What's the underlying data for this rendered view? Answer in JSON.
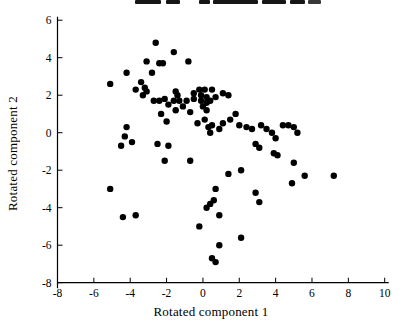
{
  "chart_data": {
    "type": "scatter",
    "title": "",
    "xlabel": "Rotated component 1",
    "ylabel": "Rotated component 2",
    "xlim": [
      -8,
      10
    ],
    "ylim": [
      -8,
      6
    ],
    "x_ticks": [
      -8,
      -6,
      -4,
      -2,
      0,
      2,
      4,
      6,
      8,
      10
    ],
    "y_ticks": [
      -8,
      -6,
      -4,
      -2,
      0,
      2,
      4,
      6
    ],
    "grid": false,
    "legend": false,
    "marker": "filled-circle",
    "marker_color": "#000000",
    "axis_color": "#000000",
    "background_color": "#ffffff",
    "points": [
      [
        -2.6,
        4.8
      ],
      [
        -1.6,
        4.3
      ],
      [
        -0.8,
        3.8
      ],
      [
        -3.1,
        3.8
      ],
      [
        -2.4,
        3.7
      ],
      [
        -2.2,
        3.7
      ],
      [
        -2.8,
        3.2
      ],
      [
        -4.2,
        3.2
      ],
      [
        -5.1,
        2.6
      ],
      [
        -3.7,
        2.3
      ],
      [
        -3.4,
        2.7
      ],
      [
        -3.2,
        2.4
      ],
      [
        -3.3,
        2.0
      ],
      [
        -3.1,
        2.2
      ],
      [
        -2.7,
        1.7
      ],
      [
        -2.4,
        1.7
      ],
      [
        -2.1,
        1.8
      ],
      [
        -1.9,
        1.5
      ],
      [
        -1.6,
        1.7
      ],
      [
        -1.5,
        2.2
      ],
      [
        -1.4,
        2.0
      ],
      [
        -1.3,
        1.7
      ],
      [
        -1.5,
        1.2
      ],
      [
        -1.1,
        1.4
      ],
      [
        -0.9,
        1.7
      ],
      [
        -0.7,
        1.1
      ],
      [
        -0.5,
        1.8
      ],
      [
        -0.5,
        2.1
      ],
      [
        -0.2,
        2.3
      ],
      [
        -0.1,
        2.0
      ],
      [
        0.1,
        2.3
      ],
      [
        -0.1,
        1.7
      ],
      [
        0.2,
        1.9
      ],
      [
        0.2,
        1.6
      ],
      [
        0.0,
        1.4
      ],
      [
        0.2,
        1.2
      ],
      [
        0.4,
        1.7
      ],
      [
        0.5,
        2.3
      ],
      [
        0.7,
        1.9
      ],
      [
        1.1,
        2.1
      ],
      [
        1.4,
        2.0
      ],
      [
        1.8,
        1.0
      ],
      [
        1.5,
        0.7
      ],
      [
        -2.3,
        1.0
      ],
      [
        -2.0,
        0.6
      ],
      [
        0.1,
        0.7
      ],
      [
        0.5,
        0.4
      ],
      [
        0.9,
        0.2
      ],
      [
        1.1,
        0.5
      ],
      [
        0.3,
        0.3
      ],
      [
        0.4,
        0.0
      ],
      [
        -0.3,
        0.5
      ],
      [
        2.0,
        0.4
      ],
      [
        2.4,
        0.3
      ],
      [
        2.7,
        0.2
      ],
      [
        3.2,
        0.4
      ],
      [
        3.5,
        0.2
      ],
      [
        3.8,
        0.0
      ],
      [
        4.0,
        -0.3
      ],
      [
        4.4,
        0.4
      ],
      [
        4.7,
        0.4
      ],
      [
        5.0,
        0.3
      ],
      [
        5.2,
        0.0
      ],
      [
        2.9,
        -0.6
      ],
      [
        3.1,
        -0.8
      ],
      [
        3.9,
        -1.1
      ],
      [
        4.1,
        -1.2
      ],
      [
        5.0,
        -1.6
      ],
      [
        5.6,
        -2.3
      ],
      [
        4.9,
        -2.7
      ],
      [
        7.2,
        -2.3
      ],
      [
        -4.2,
        0.3
      ],
      [
        -4.3,
        -0.2
      ],
      [
        -3.9,
        -0.5
      ],
      [
        -4.5,
        -0.7
      ],
      [
        -2.5,
        -0.6
      ],
      [
        -1.9,
        -0.7
      ],
      [
        -2.1,
        -1.5
      ],
      [
        -0.7,
        -1.5
      ],
      [
        1.4,
        -2.2
      ],
      [
        2.1,
        -2.0
      ],
      [
        0.7,
        -3.0
      ],
      [
        2.9,
        -3.2
      ],
      [
        3.1,
        -3.7
      ],
      [
        -5.1,
        -3.0
      ],
      [
        -4.4,
        -4.5
      ],
      [
        -3.7,
        -4.4
      ],
      [
        0.2,
        -4.0
      ],
      [
        0.4,
        -3.8
      ],
      [
        0.6,
        -3.6
      ],
      [
        0.9,
        -4.4
      ],
      [
        -0.2,
        -5.0
      ],
      [
        0.9,
        -6.0
      ],
      [
        2.1,
        -5.6
      ],
      [
        0.5,
        -6.7
      ],
      [
        0.7,
        -6.9
      ]
    ]
  }
}
